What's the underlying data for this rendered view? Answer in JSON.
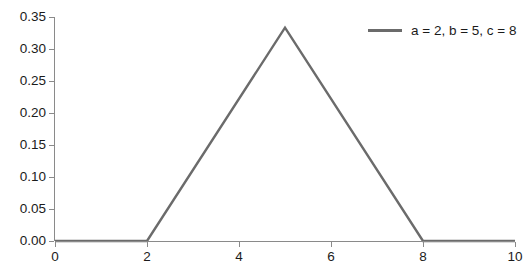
{
  "chart_data": {
    "type": "line",
    "title": "",
    "subtitle": "",
    "xlabel": "",
    "ylabel": "",
    "xlim": [
      0,
      10
    ],
    "ylim": [
      0,
      0.35
    ],
    "grid": false,
    "legend_position": "top-right",
    "x_ticks": [
      0,
      2,
      4,
      6,
      8,
      10
    ],
    "x_tick_labels": [
      "0",
      "2",
      "4",
      "6",
      "8",
      "10"
    ],
    "y_ticks": [
      0.0,
      0.05,
      0.1,
      0.15,
      0.2,
      0.25,
      0.3,
      0.35
    ],
    "y_tick_labels": [
      "0.00",
      "0.05",
      "0.10",
      "0.15",
      "0.20",
      "0.25",
      "0.30",
      "0.35"
    ],
    "series": [
      {
        "name": "a = 2, b = 5, c = 8",
        "color": "#6b6b6b",
        "x": [
          0,
          2,
          5,
          8,
          10
        ],
        "values": [
          0.0,
          0.0,
          0.3333,
          0.0,
          0.0
        ]
      }
    ],
    "annotations": []
  },
  "legend": {
    "entries": [
      {
        "label": "a = 2, b = 5, c = 8",
        "color": "#6b6b6b"
      }
    ]
  },
  "axes": {
    "axis_color": "#8a8a8a",
    "tick_text_color": "#1b1b1b"
  }
}
